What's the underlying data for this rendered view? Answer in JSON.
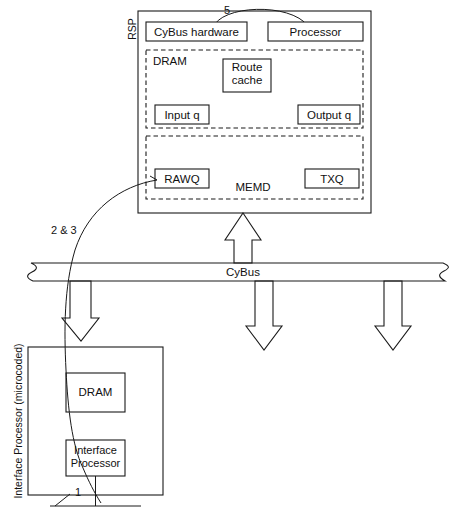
{
  "diagram": {
    "title_label": "RSP",
    "bus": {
      "label": "CyBus"
    },
    "rsp": {
      "label": "RSP",
      "top_boxes": [
        {
          "label": "CyBus hardware"
        },
        {
          "label": "Processor"
        }
      ],
      "arc_label": "5",
      "dram": {
        "label": "DRAM",
        "boxes": [
          {
            "label": "Route\ncache",
            "line1": "Route",
            "line2": "cache"
          },
          {
            "label": "Input q"
          },
          {
            "label": "Output q"
          }
        ]
      },
      "memd": {
        "label": "MEMD",
        "boxes": [
          {
            "label": "RAWQ"
          },
          {
            "label": "TXQ"
          }
        ]
      }
    },
    "interface_processor": {
      "side_label": "Interface Processor (microcoded)",
      "boxes": [
        {
          "label": "DRAM"
        },
        {
          "label": "Interface\nProcessor",
          "line1": "Interface",
          "line2": "Processor"
        }
      ],
      "pin_label": "1"
    },
    "curve_label": "2 & 3",
    "colors": {
      "stroke": "#1a1a1a",
      "fill": "#ffffff",
      "text": "#111111",
      "background": "#ffffff"
    }
  }
}
